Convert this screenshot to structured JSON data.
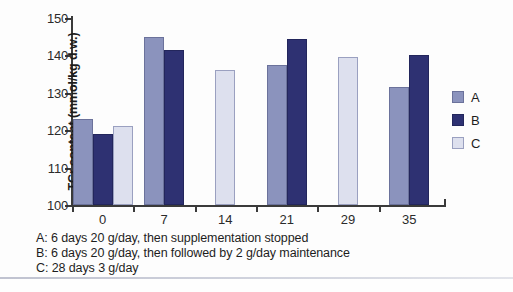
{
  "chart_data": {
    "type": "bar",
    "title": "",
    "xlabel": "",
    "ylabel": "TCr content (mmol/kg d.w.)",
    "categories": [
      "0",
      "7",
      "14",
      "21",
      "29",
      "35"
    ],
    "ylim": [
      100,
      150
    ],
    "yticks": [
      100,
      110,
      120,
      130,
      140,
      150
    ],
    "grid": false,
    "legend_position": "right",
    "series": [
      {
        "name": "A",
        "color": "#8b93bd",
        "values": [
          123,
          145,
          null,
          137.5,
          null,
          131.5
        ]
      },
      {
        "name": "B",
        "color": "#2e3172",
        "values": [
          119,
          141.5,
          null,
          144.5,
          null,
          140
        ]
      },
      {
        "name": "C",
        "color": "#dde0ee",
        "values": [
          121,
          null,
          136,
          null,
          139.5,
          null
        ]
      }
    ]
  },
  "legend": {
    "items": [
      {
        "label": "A"
      },
      {
        "label": "B"
      },
      {
        "label": "C"
      }
    ]
  },
  "caption": {
    "lines": [
      "A: 6 days 20 g/day, then supplementation stopped",
      "B: 6 days 20 g/day, then followed by 2 g/day maintenance",
      "C: 28 days 3 g/day"
    ]
  }
}
